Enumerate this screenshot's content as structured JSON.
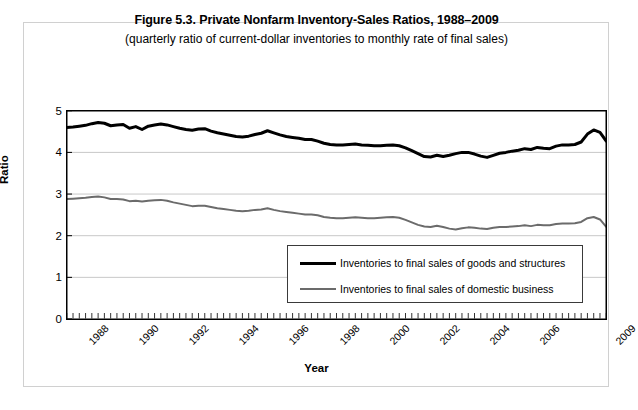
{
  "chart_data": {
    "type": "line",
    "title": "Figure 5.3. Private Nonfarm Inventory-Sales Ratios, 1988–2009",
    "subtitle": "(quarterly ratio of current-dollar inventories to monthly rate of final sales)",
    "xlabel": "Year",
    "ylabel": "Ratio",
    "ylim": [
      0,
      5
    ],
    "yticks": [
      0,
      1,
      2,
      3,
      4,
      5
    ],
    "xlim": [
      1988.0,
      2009.5
    ],
    "xticks": [
      1988,
      1990,
      1992,
      1994,
      1996,
      1998,
      2000,
      2002,
      2004,
      2006,
      2009
    ],
    "xtick_labels": [
      "1988",
      "1990",
      "1992",
      "1994",
      "1996",
      "1998",
      "2000",
      "2002",
      "2004",
      "2006",
      "2009"
    ],
    "grid": "horizontal",
    "legend_position": "inside-lower-right",
    "x": [
      1988.0,
      1988.25,
      1988.5,
      1988.75,
      1989.0,
      1989.25,
      1989.5,
      1989.75,
      1990.0,
      1990.25,
      1990.5,
      1990.75,
      1991.0,
      1991.25,
      1991.5,
      1991.75,
      1992.0,
      1992.25,
      1992.5,
      1992.75,
      1993.0,
      1993.25,
      1993.5,
      1993.75,
      1994.0,
      1994.25,
      1994.5,
      1994.75,
      1995.0,
      1995.25,
      1995.5,
      1995.75,
      1996.0,
      1996.25,
      1996.5,
      1996.75,
      1997.0,
      1997.25,
      1997.5,
      1997.75,
      1998.0,
      1998.25,
      1998.5,
      1998.75,
      1999.0,
      1999.25,
      1999.5,
      1999.75,
      2000.0,
      2000.25,
      2000.5,
      2000.75,
      2001.0,
      2001.25,
      2001.5,
      2001.75,
      2002.0,
      2002.25,
      2002.5,
      2002.75,
      2003.0,
      2003.25,
      2003.5,
      2003.75,
      2004.0,
      2004.25,
      2004.5,
      2004.75,
      2005.0,
      2005.25,
      2005.5,
      2005.75,
      2006.0,
      2006.25,
      2006.5,
      2006.75,
      2007.0,
      2007.25,
      2007.5,
      2007.75,
      2008.0,
      2008.25,
      2008.5,
      2008.75,
      2009.0,
      2009.25,
      2009.5
    ],
    "series": [
      {
        "name": "Inventories to final sales of goods and structures",
        "color": "#000000",
        "width": 3,
        "values": [
          4.6,
          4.61,
          4.63,
          4.65,
          4.69,
          4.72,
          4.7,
          4.64,
          4.66,
          4.67,
          4.58,
          4.62,
          4.55,
          4.63,
          4.66,
          4.68,
          4.66,
          4.62,
          4.58,
          4.55,
          4.53,
          4.56,
          4.57,
          4.51,
          4.47,
          4.44,
          4.41,
          4.38,
          4.37,
          4.39,
          4.43,
          4.46,
          4.52,
          4.47,
          4.42,
          4.38,
          4.36,
          4.34,
          4.31,
          4.31,
          4.27,
          4.22,
          4.19,
          4.18,
          4.18,
          4.19,
          4.2,
          4.18,
          4.17,
          4.16,
          4.16,
          4.17,
          4.18,
          4.16,
          4.11,
          4.04,
          3.97,
          3.9,
          3.89,
          3.93,
          3.9,
          3.93,
          3.97,
          4.0,
          4.0,
          3.96,
          3.91,
          3.88,
          3.93,
          3.98,
          4.0,
          4.03,
          4.05,
          4.09,
          4.07,
          4.12,
          4.1,
          4.09,
          4.15,
          4.18,
          4.18,
          4.19,
          4.25,
          4.44,
          4.54,
          4.48,
          4.27
        ],
        "annotations": [
          {
            "label": "peak 1989",
            "x": 1989.25,
            "y": 4.72
          },
          {
            "label": "trough 2002",
            "x": 2002.5,
            "y": 3.89
          },
          {
            "label": "peak 2009",
            "x": 2009.0,
            "y": 4.54
          }
        ]
      },
      {
        "name": "Inventories to final sales of domestic business",
        "color": "#6b6b6b",
        "width": 2,
        "values": [
          2.88,
          2.89,
          2.9,
          2.91,
          2.93,
          2.94,
          2.92,
          2.88,
          2.88,
          2.87,
          2.83,
          2.84,
          2.82,
          2.84,
          2.85,
          2.86,
          2.84,
          2.8,
          2.77,
          2.74,
          2.71,
          2.72,
          2.72,
          2.69,
          2.66,
          2.64,
          2.62,
          2.6,
          2.59,
          2.6,
          2.62,
          2.63,
          2.66,
          2.62,
          2.59,
          2.57,
          2.55,
          2.53,
          2.51,
          2.51,
          2.49,
          2.45,
          2.43,
          2.42,
          2.42,
          2.43,
          2.44,
          2.43,
          2.42,
          2.42,
          2.43,
          2.44,
          2.45,
          2.43,
          2.38,
          2.32,
          2.26,
          2.22,
          2.21,
          2.24,
          2.21,
          2.17,
          2.15,
          2.18,
          2.2,
          2.19,
          2.17,
          2.16,
          2.19,
          2.21,
          2.21,
          2.22,
          2.23,
          2.25,
          2.23,
          2.26,
          2.25,
          2.25,
          2.28,
          2.29,
          2.29,
          2.3,
          2.33,
          2.42,
          2.45,
          2.39,
          2.21
        ],
        "annotations": [
          {
            "label": "peak 1989",
            "x": 1989.25,
            "y": 2.94
          },
          {
            "label": "trough 2003",
            "x": 2003.5,
            "y": 2.15
          },
          {
            "label": "peak 2009",
            "x": 2009.0,
            "y": 2.45
          }
        ]
      }
    ]
  },
  "legend": {
    "items": [
      {
        "label": "Inventories to final sales of goods and structures",
        "style": "thick"
      },
      {
        "label": "Inventories to final sales of domestic business",
        "style": "thin"
      }
    ]
  },
  "colors": {
    "series_black": "#000000",
    "series_gray": "#6b6b6b",
    "gridline": "#c8c8c8",
    "axis": "#000000",
    "frame": "#d0d0d0"
  }
}
